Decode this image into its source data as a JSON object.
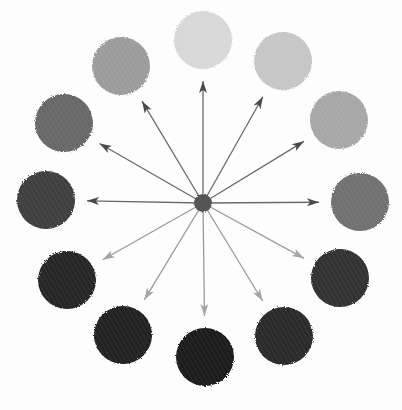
{
  "diagram": {
    "title": "",
    "hub": {
      "cx": 203,
      "cy": 203,
      "r": 9,
      "color": "#555555"
    },
    "arrow_color": "#6a6a6a",
    "circle_radius": 29,
    "circles": [
      {
        "cx": 203,
        "cy": 40,
        "color": "#d8d8d8",
        "label": "value-1"
      },
      {
        "cx": 283,
        "cy": 61,
        "color": "#c6c6c6",
        "label": "value-2"
      },
      {
        "cx": 339,
        "cy": 120,
        "color": "#a7a7a7",
        "label": "value-3"
      },
      {
        "cx": 360,
        "cy": 202,
        "color": "#717171",
        "label": "value-4"
      },
      {
        "cx": 340,
        "cy": 278,
        "color": "#303030",
        "label": "value-5"
      },
      {
        "cx": 284,
        "cy": 336,
        "color": "#2b2b2b",
        "label": "value-6"
      },
      {
        "cx": 205,
        "cy": 357,
        "color": "#1d1d1d",
        "label": "value-7"
      },
      {
        "cx": 123,
        "cy": 335,
        "color": "#232323",
        "label": "value-8"
      },
      {
        "cx": 67,
        "cy": 280,
        "color": "#262626",
        "label": "value-9"
      },
      {
        "cx": 46,
        "cy": 200,
        "color": "#404040",
        "label": "value-10"
      },
      {
        "cx": 64,
        "cy": 123,
        "color": "#686868",
        "label": "value-11"
      },
      {
        "cx": 121,
        "cy": 66,
        "color": "#9c9c9c",
        "label": "value-12"
      }
    ]
  }
}
